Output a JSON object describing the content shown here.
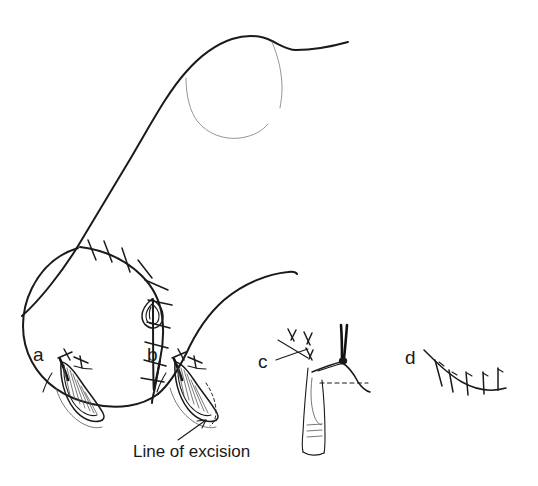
{
  "figure": {
    "background_color": "#ffffff",
    "ink_color": "#1a1a1a",
    "faint_ink_color": "#8a8a8a"
  },
  "caption": {
    "line_of_excision": "Line of excision"
  },
  "panels": [
    {
      "letter": "a",
      "name": "panel-a-dog-ear-raised",
      "description": "Dog-ear of redundant skin raised at end of suture line",
      "x": 33,
      "y": 345
    },
    {
      "letter": "b",
      "name": "panel-b-line-of-excision-marked",
      "description": "Dog-ear with dashed line of excision marked and arrow indicator",
      "x": 147,
      "y": 345
    },
    {
      "letter": "c",
      "name": "panel-c-forceps-elevation",
      "description": "Forceps elevate the dog-ear, dashed excision line at base, finger supporting below",
      "x": 258,
      "y": 352
    },
    {
      "letter": "d",
      "name": "panel-d-closed-suture-line",
      "description": "Completed flattened suture line after dog-ear excision",
      "x": 405,
      "y": 348
    }
  ],
  "main_figure": {
    "name": "breast-with-sutured-incision",
    "description": "Lateral view of chest and breast mound with curved sutured incision and terminal dog-ear",
    "suture_marks": 10,
    "dog_ear_marker": "teardrop-dog-ear"
  }
}
